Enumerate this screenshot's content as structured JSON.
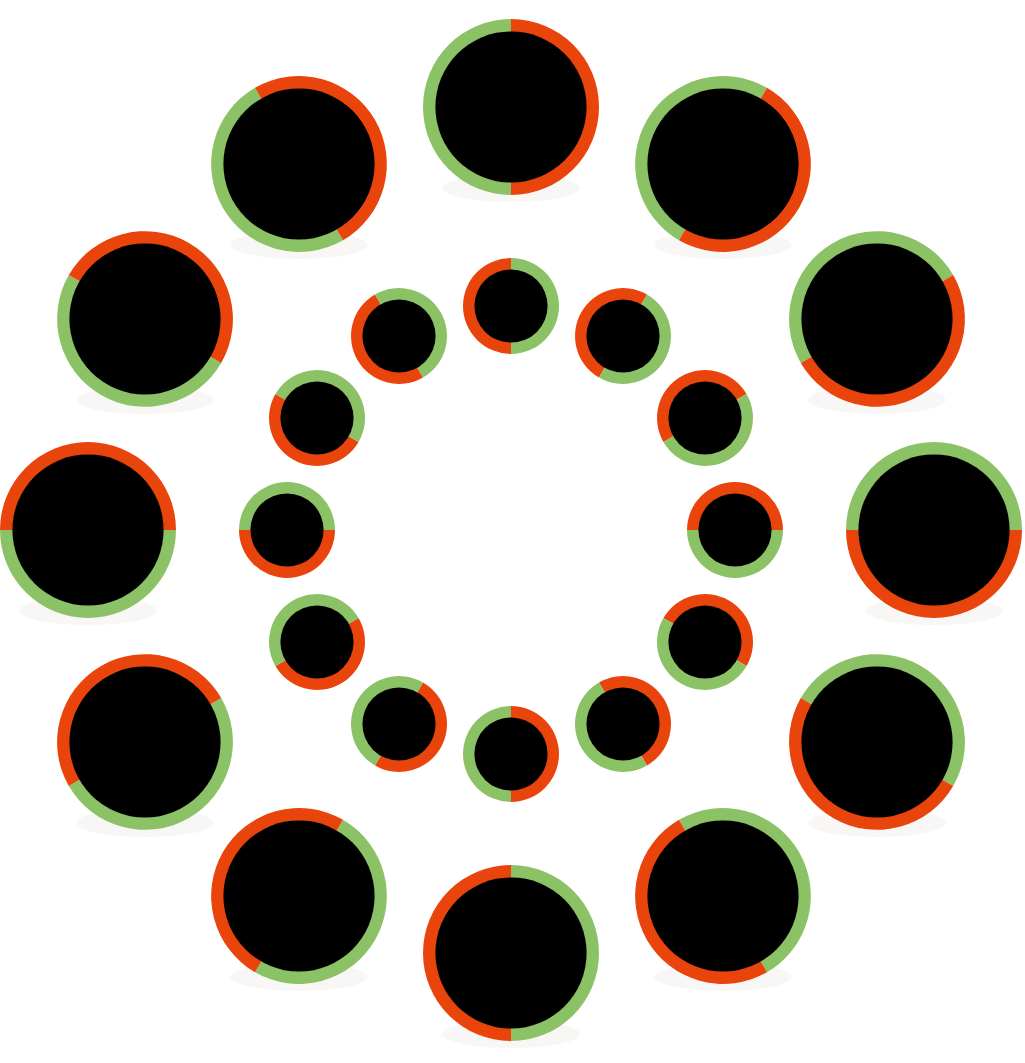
{
  "canvas": {
    "width": 1025,
    "height": 1063,
    "background": "#ffffff",
    "center_x": 511,
    "center_y": 530
  },
  "palette": {
    "orange": "#e8440c",
    "green": "#8bc265",
    "disc_fill": "#000000",
    "background": "#ffffff",
    "shadow": "#f3f0ee"
  },
  "figure": {
    "name": "rotating-circles-illusion",
    "disc_count_total": 24
  },
  "chart_data": {
    "type": "scatter",
    "xlabel": "",
    "ylabel": "",
    "xlim": [
      0,
      1025
    ],
    "ylim": [
      0,
      1063
    ],
    "grid": false,
    "legend": null,
    "series": [
      {
        "name": "outer-ring",
        "count": 12,
        "orbit_radius": 423,
        "outer_diameter": 176,
        "band_width": 13,
        "start_angle_deg": -90,
        "angle_step_deg": 30,
        "ccw_color": "#8bc265",
        "cw_color": "#e8440c",
        "discs": [
          {
            "index": 0,
            "angle_deg": -90,
            "cx": 511,
            "cy": 107,
            "r_outer": 88,
            "r_inner": 75,
            "left_color": "#8bc265",
            "right_color": "#e8440c",
            "split_rotation_deg": 0
          },
          {
            "index": 1,
            "angle_deg": -60,
            "cx": 723,
            "cy": 164,
            "r_outer": 88,
            "r_inner": 75,
            "left_color": "#8bc265",
            "right_color": "#e8440c",
            "split_rotation_deg": 30
          },
          {
            "index": 2,
            "angle_deg": -30,
            "cx": 877,
            "cy": 319,
            "r_outer": 88,
            "r_inner": 75,
            "left_color": "#8bc265",
            "right_color": "#e8440c",
            "split_rotation_deg": 60
          },
          {
            "index": 3,
            "angle_deg": 0,
            "cx": 934,
            "cy": 530,
            "r_outer": 88,
            "r_inner": 75,
            "left_color": "#8bc265",
            "right_color": "#e8440c",
            "split_rotation_deg": 90
          },
          {
            "index": 4,
            "angle_deg": 30,
            "cx": 877,
            "cy": 742,
            "r_outer": 88,
            "r_inner": 75,
            "left_color": "#8bc265",
            "right_color": "#e8440c",
            "split_rotation_deg": 120
          },
          {
            "index": 5,
            "angle_deg": 60,
            "cx": 723,
            "cy": 896,
            "r_outer": 88,
            "r_inner": 75,
            "left_color": "#8bc265",
            "right_color": "#e8440c",
            "split_rotation_deg": 150
          },
          {
            "index": 6,
            "angle_deg": 90,
            "cx": 511,
            "cy": 953,
            "r_outer": 88,
            "r_inner": 75,
            "left_color": "#8bc265",
            "right_color": "#e8440c",
            "split_rotation_deg": 180
          },
          {
            "index": 7,
            "angle_deg": 120,
            "cx": 299,
            "cy": 896,
            "r_outer": 88,
            "r_inner": 75,
            "left_color": "#8bc265",
            "right_color": "#e8440c",
            "split_rotation_deg": 210
          },
          {
            "index": 8,
            "angle_deg": 150,
            "cx": 145,
            "cy": 742,
            "r_outer": 88,
            "r_inner": 75,
            "left_color": "#8bc265",
            "right_color": "#e8440c",
            "split_rotation_deg": 240
          },
          {
            "index": 9,
            "angle_deg": 180,
            "cx": 88,
            "cy": 530,
            "r_outer": 88,
            "r_inner": 75,
            "left_color": "#8bc265",
            "right_color": "#e8440c",
            "split_rotation_deg": 270
          },
          {
            "index": 10,
            "angle_deg": 210,
            "cx": 145,
            "cy": 319,
            "r_outer": 88,
            "r_inner": 75,
            "left_color": "#8bc265",
            "right_color": "#e8440c",
            "split_rotation_deg": 300
          },
          {
            "index": 11,
            "angle_deg": 240,
            "cx": 299,
            "cy": 164,
            "r_outer": 88,
            "r_inner": 75,
            "left_color": "#8bc265",
            "right_color": "#e8440c",
            "split_rotation_deg": 330
          }
        ]
      },
      {
        "name": "inner-ring",
        "count": 12,
        "orbit_radius": 224,
        "outer_diameter": 96,
        "band_width": 12,
        "start_angle_deg": -90,
        "angle_step_deg": 30,
        "ccw_color": "#e8440c",
        "cw_color": "#8bc265",
        "discs": [
          {
            "index": 0,
            "angle_deg": -90,
            "cx": 511,
            "cy": 306,
            "r_outer": 48,
            "r_inner": 36,
            "left_color": "#e8440c",
            "right_color": "#8bc265",
            "split_rotation_deg": 0
          },
          {
            "index": 1,
            "angle_deg": -60,
            "cx": 623,
            "cy": 336,
            "r_outer": 48,
            "r_inner": 36,
            "left_color": "#e8440c",
            "right_color": "#8bc265",
            "split_rotation_deg": 30
          },
          {
            "index": 2,
            "angle_deg": -30,
            "cx": 705,
            "cy": 418,
            "r_outer": 48,
            "r_inner": 36,
            "left_color": "#e8440c",
            "right_color": "#8bc265",
            "split_rotation_deg": 60
          },
          {
            "index": 3,
            "angle_deg": 0,
            "cx": 735,
            "cy": 530,
            "r_outer": 48,
            "r_inner": 36,
            "left_color": "#e8440c",
            "right_color": "#8bc265",
            "split_rotation_deg": 90
          },
          {
            "index": 4,
            "angle_deg": 30,
            "cx": 705,
            "cy": 642,
            "r_outer": 48,
            "r_inner": 36,
            "left_color": "#e8440c",
            "right_color": "#8bc265",
            "split_rotation_deg": 120
          },
          {
            "index": 5,
            "angle_deg": 60,
            "cx": 623,
            "cy": 724,
            "r_outer": 48,
            "r_inner": 36,
            "left_color": "#e8440c",
            "right_color": "#8bc265",
            "split_rotation_deg": 150
          },
          {
            "index": 6,
            "angle_deg": 90,
            "cx": 511,
            "cy": 754,
            "r_outer": 48,
            "r_inner": 36,
            "left_color": "#e8440c",
            "right_color": "#8bc265",
            "split_rotation_deg": 180
          },
          {
            "index": 7,
            "angle_deg": 120,
            "cx": 399,
            "cy": 724,
            "r_outer": 48,
            "r_inner": 36,
            "left_color": "#e8440c",
            "right_color": "#8bc265",
            "split_rotation_deg": 210
          },
          {
            "index": 8,
            "angle_deg": 150,
            "cx": 317,
            "cy": 642,
            "r_outer": 48,
            "r_inner": 36,
            "left_color": "#e8440c",
            "right_color": "#8bc265",
            "split_rotation_deg": 240
          },
          {
            "index": 9,
            "angle_deg": 180,
            "cx": 287,
            "cy": 530,
            "r_outer": 48,
            "r_inner": 36,
            "left_color": "#e8440c",
            "right_color": "#8bc265",
            "split_rotation_deg": 270
          },
          {
            "index": 10,
            "angle_deg": 210,
            "cx": 317,
            "cy": 418,
            "r_outer": 48,
            "r_inner": 36,
            "left_color": "#e8440c",
            "right_color": "#8bc265",
            "split_rotation_deg": 300
          },
          {
            "index": 11,
            "angle_deg": 240,
            "cx": 399,
            "cy": 336,
            "r_outer": 48,
            "r_inner": 36,
            "left_color": "#e8440c",
            "right_color": "#8bc265",
            "split_rotation_deg": 330
          }
        ]
      }
    ]
  }
}
